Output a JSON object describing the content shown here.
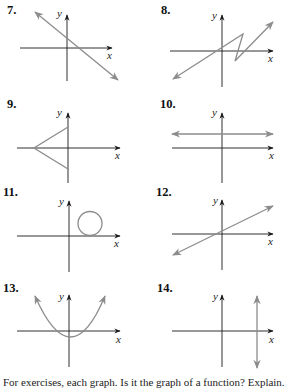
{
  "exercises": [
    {
      "number": "7.",
      "x_label": "x",
      "y_label": "y",
      "graph": "straight line with negative slope crossing both axes"
    },
    {
      "number": "8.",
      "x_label": "x",
      "y_label": "y",
      "graph": "zigzag (Z-shaped) polyline rising left to right"
    },
    {
      "number": "9.",
      "x_label": "x",
      "y_label": "y",
      "graph": "sideways V (two segments from a vertex on negative x-axis to the y-axis)"
    },
    {
      "number": "10.",
      "x_label": "x",
      "y_label": "y",
      "graph": "horizontal line above x-axis"
    },
    {
      "number": "11.",
      "x_label": "x",
      "y_label": "y",
      "graph": "circle in first quadrant tangent to x-axis"
    },
    {
      "number": "12.",
      "x_label": "x",
      "y_label": "y",
      "graph": "straight line with positive slope"
    },
    {
      "number": "13.",
      "x_label": "x",
      "y_label": "y",
      "graph": "upward-opening parabola with vertex below origin"
    },
    {
      "number": "14.",
      "x_label": "x",
      "y_label": "y",
      "graph": "vertical line to the right of y-axis"
    }
  ],
  "footer_text": "For exercises, each graph. Is it the graph of a function? Explain.",
  "colors": {
    "axis": "#1a1a1a",
    "curve": "#8c8c8c",
    "text": "#111111"
  }
}
